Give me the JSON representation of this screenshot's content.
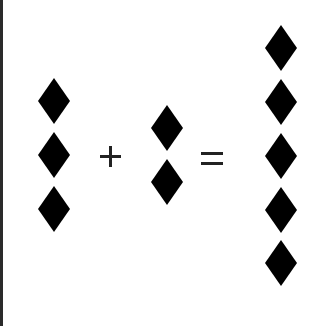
{
  "diagram": {
    "type": "visual addition equation",
    "left_term": {
      "count": 3,
      "symbol": "diamond-icon",
      "color": "#000000"
    },
    "operator_plus": "+",
    "right_term": {
      "count": 2,
      "symbol": "diamond-icon",
      "color": "#000000"
    },
    "operator_equals": "=",
    "result": {
      "count": 5,
      "symbol": "diamond-icon",
      "color": "#000000"
    },
    "border_color": "#2a2a2a",
    "background": "#ffffff"
  }
}
